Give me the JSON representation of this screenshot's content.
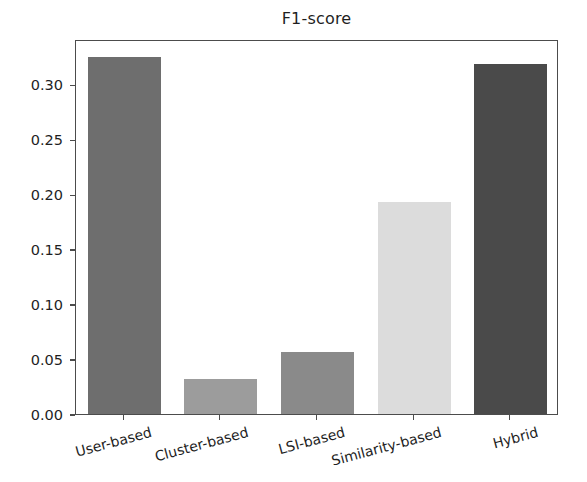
{
  "chart_data": {
    "type": "bar",
    "title": "F1-score",
    "xlabel": "",
    "ylabel": "",
    "categories": [
      "User-based",
      "Cluster-based",
      "LSI-based",
      "Similarity-based",
      "Hybrid"
    ],
    "values": [
      0.325,
      0.032,
      0.056,
      0.193,
      0.318
    ],
    "series": [
      {
        "name": "F1-score",
        "values": [
          0.325,
          0.032,
          0.056,
          0.193,
          0.318
        ]
      }
    ],
    "ylim": [
      0.0,
      0.341
    ],
    "yticks": [
      "0.00",
      "0.05",
      "0.10",
      "0.15",
      "0.20",
      "0.25",
      "0.30"
    ],
    "ytick_values": [
      0.0,
      0.05,
      0.1,
      0.15,
      0.2,
      0.25,
      0.3
    ],
    "grid": false,
    "legend": "none",
    "bar_colors": [
      "#6e6e6e",
      "#9c9c9c",
      "#8a8a8a",
      "#dcdcdc",
      "#4a4a4a"
    ],
    "axis_color": "#4c4c4c",
    "background": "#ffffff",
    "xtick_rotation": -15
  }
}
